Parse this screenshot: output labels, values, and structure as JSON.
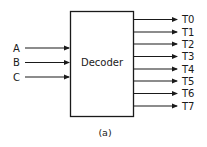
{
  "diagram": {
    "block_label": "Decoder",
    "inputs": [
      "A",
      "B",
      "C"
    ],
    "outputs": [
      "T0",
      "T1",
      "T2",
      "T3",
      "T4",
      "T5",
      "T6",
      "T7"
    ],
    "caption": "(a)",
    "colors": {
      "stroke": "#1a1a1a",
      "background": "#ffffff"
    }
  }
}
